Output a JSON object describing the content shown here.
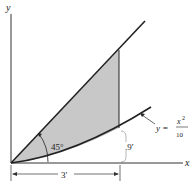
{
  "diagram": {
    "axes": {
      "x_label": "x",
      "y_label": "y"
    },
    "angle_label": "45°",
    "curve_label": {
      "lhs": "y =",
      "numerator": "x",
      "exponent": "2",
      "denominator": "10"
    },
    "dimensions": {
      "width": "3′",
      "height": ".9′"
    },
    "colors": {
      "shade": "#c8c8c8",
      "line": "#222222"
    }
  }
}
